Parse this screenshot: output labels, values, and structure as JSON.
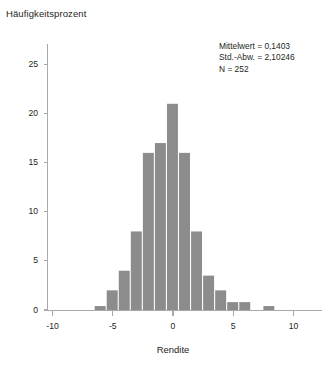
{
  "chart_data": {
    "type": "bar",
    "title": "Häufigkeitsprozent",
    "subtitle": "",
    "xlabel": "Rendite",
    "ylabel": "Häufigkeitsprozent",
    "xlim": [
      -12,
      11.5
    ],
    "ylim": [
      0,
      27.5
    ],
    "grid": false,
    "legend_position": "none",
    "bin_width": 1,
    "xticks": [
      -10,
      -5,
      0,
      5,
      10
    ],
    "xtick_labels": [
      "-10",
      "-5",
      "0",
      "5",
      "10"
    ],
    "yticks": [
      0,
      5,
      10,
      15,
      20,
      25
    ],
    "ytick_labels": [
      "0",
      "5",
      "10",
      "15",
      "20",
      "25"
    ],
    "bar_color": "#8c8c8c",
    "axis_color": "#a7a9ac",
    "categories": [
      -6,
      -5,
      -4,
      -3,
      -2,
      -1,
      0,
      1,
      2,
      3,
      4,
      5,
      6,
      8
    ],
    "values": [
      0.4,
      2.0,
      4.0,
      8.0,
      16.0,
      17.0,
      21.0,
      16.0,
      8.0,
      3.5,
      2.0,
      0.8,
      0.8,
      0.4
    ],
    "annotations": [
      "Mittelwert = 0,1403",
      "Std.-Abw. = 2,10246",
      "N = 252"
    ],
    "annotation_lines": {
      "mean": "Mittelwert = 0,1403",
      "std": "Std.-Abw. = 2,10246",
      "n": "N = 252"
    }
  }
}
